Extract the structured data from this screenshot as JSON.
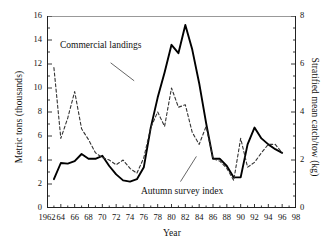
{
  "chart_data": {
    "type": "line",
    "title": "",
    "xlabel": "Year",
    "ylabel": "Metric tons (thousands)",
    "ylabel_right": "Stratified mean catch/tow (kg)",
    "xlim": [
      1962,
      1998
    ],
    "ylim": [
      0,
      16
    ],
    "ylim_right": [
      0,
      8
    ],
    "xticks": [
      1962,
      1964,
      1966,
      1968,
      1970,
      1972,
      1974,
      1976,
      1978,
      1980,
      1982,
      1984,
      1986,
      1988,
      1990,
      1992,
      1994,
      1996,
      1998
    ],
    "xtick_labels": [
      "1962",
      "64",
      "66",
      "68",
      "70",
      "72",
      "74",
      "76",
      "78",
      "80",
      "82",
      "84",
      "86",
      "88",
      "90",
      "92",
      "94",
      "96",
      "98"
    ],
    "yticks": [
      0,
      2,
      4,
      6,
      8,
      10,
      12,
      14,
      16
    ],
    "ytick_labels": [
      "0",
      "2",
      "4",
      "6",
      "8",
      "10",
      "12",
      "14",
      "16"
    ],
    "yticks_right": [
      0,
      2,
      4,
      6,
      8
    ],
    "ytick_labels_right": [
      "0",
      "2",
      "4",
      "6",
      "8"
    ],
    "grid": false,
    "legend_position": "inline-annotations",
    "minor_ticks_x": "every year",
    "minor_ticks_y": "midpoints",
    "series": [
      {
        "name": "Commercial landings",
        "style": "solid",
        "color": "#000000",
        "axis": "left",
        "units": "thousands of metric tons",
        "x": [
          1963,
          1964,
          1965,
          1966,
          1967,
          1968,
          1969,
          1970,
          1971,
          1972,
          1973,
          1974,
          1975,
          1976,
          1977,
          1978,
          1979,
          1980,
          1981,
          1982,
          1983,
          1984,
          1985,
          1986,
          1987,
          1988,
          1989,
          1990,
          1991,
          1992,
          1993,
          1994,
          1995,
          1996
        ],
        "values": [
          2.4,
          3.75,
          3.7,
          3.9,
          4.5,
          4.1,
          4.1,
          4.35,
          3.5,
          2.8,
          2.3,
          2.2,
          2.4,
          3.4,
          6.7,
          9.2,
          11.3,
          13.6,
          12.9,
          15.25,
          13.2,
          10.4,
          7.1,
          4.1,
          4.1,
          3.5,
          2.55,
          2.55,
          5.3,
          6.7,
          5.8,
          5.3,
          4.9,
          4.6
        ]
      },
      {
        "name": "Autumn survey index",
        "style": "dashed",
        "color": "#333333",
        "axis": "right",
        "units": "kg per tow",
        "x": [
          1963,
          1964,
          1965,
          1966,
          1967,
          1968,
          1969,
          1970,
          1971,
          1972,
          1973,
          1974,
          1975,
          1976,
          1977,
          1978,
          1979,
          1980,
          1981,
          1982,
          1983,
          1984,
          1985,
          1986,
          1987,
          1988,
          1989,
          1990,
          1991,
          1992,
          1993,
          1994,
          1995,
          1996
        ],
        "values_left_scale": [
          11.7,
          5.8,
          7.5,
          9.7,
          6.6,
          5.7,
          4.6,
          4.2,
          4.0,
          3.6,
          4.0,
          3.3,
          2.9,
          4.2,
          6.7,
          8.0,
          6.8,
          10.0,
          8.4,
          8.6,
          6.3,
          5.3,
          6.8,
          4.1,
          3.9,
          3.3,
          2.3,
          5.8,
          3.4,
          3.8,
          4.6,
          5.3,
          5.3,
          4.6
        ],
        "values": [
          5.85,
          2.9,
          3.75,
          4.85,
          3.3,
          2.85,
          2.3,
          2.1,
          2.0,
          1.8,
          2.0,
          1.65,
          1.45,
          2.1,
          3.35,
          4.0,
          3.4,
          5.0,
          4.2,
          4.3,
          3.15,
          2.65,
          3.4,
          2.05,
          1.95,
          1.65,
          1.15,
          2.9,
          1.7,
          1.9,
          2.3,
          2.65,
          2.65,
          2.3
        ]
      }
    ],
    "annotations": [
      {
        "text": "Commercial landings",
        "x": 1967.5,
        "y": 13.0
      },
      {
        "text": "Autumn survey index",
        "x": 1981.0,
        "y": 1.3
      }
    ]
  },
  "axes": {
    "left_title": "Metric tons (thousands)",
    "right_title": "Stratified mean catch/tow (kg)",
    "x_title": "Year"
  },
  "annotations": {
    "commercial": "Commercial landings",
    "autumn": "Autumn survey index"
  }
}
